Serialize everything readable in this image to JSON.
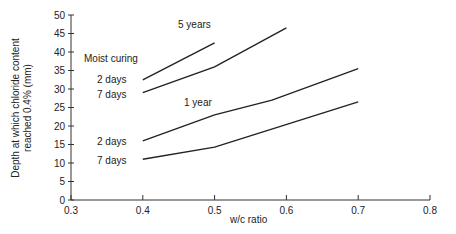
{
  "chart_data": {
    "type": "line",
    "title": "",
    "xlabel": "w/c ratio",
    "ylabel": "Depth at which chloride content reached 0.4% (mm)",
    "ylabel_lines": [
      "Depth at which chloride content",
      "reached 0.4% (mm)"
    ],
    "xlim": [
      0.3,
      0.8
    ],
    "ylim": [
      0,
      50
    ],
    "x_ticks": [
      "0.3",
      "0.4",
      "0.5",
      "0.6",
      "0.7",
      "0.8"
    ],
    "y_ticks": [
      "0",
      "5",
      "10",
      "15",
      "20",
      "25",
      "30",
      "35",
      "40",
      "45",
      "50"
    ],
    "grid": false,
    "legend": "inline annotations",
    "annotations": {
      "moist_curing": "Moist curing",
      "five_years": "5 years",
      "one_year": "1 year",
      "five_yr_2days": "2 days",
      "five_yr_7days": "7 days",
      "one_yr_2days": "2 days",
      "one_yr_7days": "7 days"
    },
    "series": [
      {
        "name": "5 years, 2 days moist curing",
        "x": [
          0.4,
          0.5
        ],
        "values": [
          32.5,
          42.5
        ]
      },
      {
        "name": "5 years, 7 days moist curing",
        "x": [
          0.4,
          0.5,
          0.6
        ],
        "values": [
          29,
          36,
          46.5
        ]
      },
      {
        "name": "1 year, 2 days moist curing",
        "x": [
          0.4,
          0.5,
          0.58,
          0.7
        ],
        "values": [
          16,
          23,
          27,
          35.5
        ]
      },
      {
        "name": "1 year, 7 days moist curing",
        "x": [
          0.4,
          0.5,
          0.7
        ],
        "values": [
          11,
          14.3,
          26.5
        ]
      }
    ]
  }
}
